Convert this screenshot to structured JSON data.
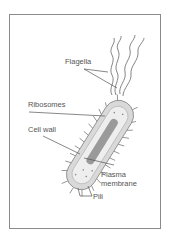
{
  "diagram": {
    "labels": {
      "flagella": "Flagella",
      "ribosomes": "Ribosomes",
      "cell_wall": "Cell wall",
      "plasma_membrane_line1": "Plasma",
      "plasma_membrane_line2": "membrane",
      "pili": "Pili"
    },
    "colors": {
      "frame": "#8a8a8a",
      "cell_fill": "#d9d9d9",
      "cell_inner": "#eeeeee",
      "nucleoid": "#9a9a9a",
      "line": "#555555"
    }
  }
}
